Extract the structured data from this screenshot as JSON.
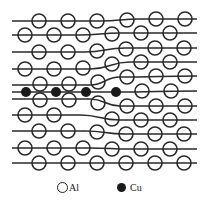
{
  "figure": {
    "colors": {
      "line": "#2a2a2a",
      "atom_stroke": "#2a2a2a",
      "cu_fill": "#1a1a1a",
      "background": "#ffffff"
    },
    "atom_radius": 7,
    "lattice_lines": [
      {
        "points": [
          [
            12,
            21
          ],
          [
            100,
            21
          ],
          [
            140,
            19
          ],
          [
            197,
            19
          ]
        ]
      },
      {
        "points": [
          [
            12,
            35
          ],
          [
            80,
            35
          ],
          [
            120,
            33
          ],
          [
            197,
            33
          ]
        ]
      },
      {
        "points": [
          [
            12,
            52
          ],
          [
            85,
            52
          ],
          [
            125,
            48
          ],
          [
            197,
            48
          ]
        ]
      },
      {
        "points": [
          [
            12,
            69
          ],
          [
            90,
            69
          ],
          [
            130,
            62
          ],
          [
            197,
            62
          ]
        ]
      },
      {
        "points": [
          [
            12,
            85
          ],
          [
            90,
            85
          ],
          [
            120,
            77
          ],
          [
            197,
            76
          ]
        ]
      },
      {
        "points": [
          [
            12,
            92
          ],
          [
            115,
            92
          ],
          [
            197,
            91
          ]
        ]
      },
      {
        "points": [
          [
            12,
            99
          ],
          [
            90,
            99
          ],
          [
            120,
            106
          ],
          [
            197,
            106
          ]
        ]
      },
      {
        "points": [
          [
            12,
            115
          ],
          [
            80,
            115
          ],
          [
            120,
            120
          ],
          [
            197,
            120
          ]
        ]
      },
      {
        "points": [
          [
            12,
            131
          ],
          [
            85,
            131
          ],
          [
            125,
            134
          ],
          [
            197,
            134
          ]
        ]
      },
      {
        "points": [
          [
            12,
            148
          ],
          [
            90,
            148
          ],
          [
            130,
            149
          ],
          [
            197,
            149
          ]
        ]
      },
      {
        "points": [
          [
            12,
            163
          ],
          [
            100,
            163
          ],
          [
            140,
            163
          ],
          [
            197,
            163
          ]
        ]
      }
    ],
    "al_atoms": [
      [
        39,
        21
      ],
      [
        68,
        21
      ],
      [
        97,
        21
      ],
      [
        127,
        20
      ],
      [
        156,
        19
      ],
      [
        185,
        19
      ],
      [
        25,
        35
      ],
      [
        54,
        35
      ],
      [
        83,
        35
      ],
      [
        112,
        34
      ],
      [
        141,
        33
      ],
      [
        170,
        33
      ],
      [
        39,
        52
      ],
      [
        68,
        52
      ],
      [
        97,
        51
      ],
      [
        126,
        49
      ],
      [
        155,
        48
      ],
      [
        184,
        48
      ],
      [
        25,
        69
      ],
      [
        54,
        69
      ],
      [
        83,
        68
      ],
      [
        112,
        64
      ],
      [
        141,
        62
      ],
      [
        170,
        62
      ],
      [
        40,
        84
      ],
      [
        69,
        84
      ],
      [
        98,
        82
      ],
      [
        127,
        77
      ],
      [
        156,
        76
      ],
      [
        185,
        76
      ],
      [
        142,
        91
      ],
      [
        171,
        91
      ],
      [
        40,
        100
      ],
      [
        69,
        100
      ],
      [
        98,
        103
      ],
      [
        127,
        106
      ],
      [
        156,
        106
      ],
      [
        185,
        106
      ],
      [
        25,
        115
      ],
      [
        54,
        115
      ],
      [
        112,
        119
      ],
      [
        141,
        120
      ],
      [
        170,
        120
      ],
      [
        39,
        131
      ],
      [
        68,
        131
      ],
      [
        97,
        132
      ],
      [
        126,
        134
      ],
      [
        155,
        134
      ],
      [
        184,
        134
      ],
      [
        25,
        148
      ],
      [
        54,
        148
      ],
      [
        83,
        148
      ],
      [
        112,
        149
      ],
      [
        141,
        149
      ],
      [
        170,
        149
      ],
      [
        39,
        163
      ],
      [
        68,
        163
      ],
      [
        97,
        163
      ],
      [
        126,
        163
      ],
      [
        155,
        163
      ],
      [
        184,
        163
      ]
    ],
    "cu_atoms": [
      [
        26,
        92
      ],
      [
        56,
        92
      ],
      [
        86,
        92
      ],
      [
        116,
        92
      ]
    ],
    "cu_radius": 5
  },
  "legend": {
    "items": [
      {
        "symbol": "open-circle",
        "label": "Al"
      },
      {
        "symbol": "filled-circle",
        "label": "Cu"
      }
    ]
  }
}
